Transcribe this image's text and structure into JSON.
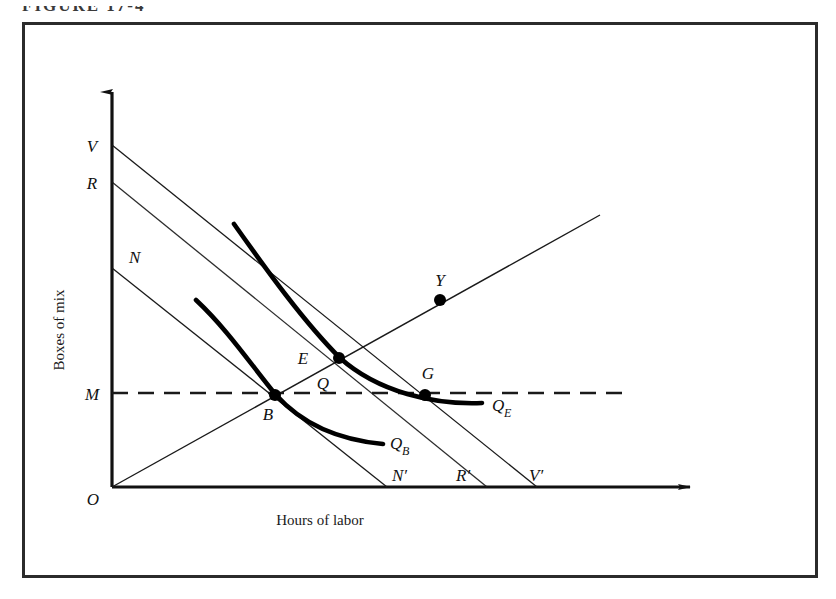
{
  "figure": {
    "title": "FIGURE 17-4",
    "frame": {
      "x": 22,
      "y": 22,
      "width": 796,
      "height": 556,
      "stroke": "#2b2b2b"
    }
  },
  "axes": {
    "y_title": "Boxes of mix",
    "x_title": "Hours of labor",
    "origin_label": "O",
    "y_axis": {
      "x": 112,
      "y_bottom": 487,
      "y_top": 82
    },
    "x_axis": {
      "y": 487,
      "x_left": 112,
      "x_right": 700
    }
  },
  "intercepts": {
    "V": {
      "label": "V",
      "x": 112,
      "y": 145
    },
    "R": {
      "label": "R",
      "x": 112,
      "y": 182
    },
    "N": {
      "label": "N",
      "x": 112,
      "y": 268
    },
    "M": {
      "label": "M",
      "x": 112,
      "y": 393
    },
    "Nprime": {
      "label": "N′",
      "x": 387,
      "y": 487
    },
    "Rprime": {
      "label": "R′",
      "x": 487,
      "y": 487
    },
    "Vprime": {
      "label": "V′",
      "x": 537,
      "y": 487
    }
  },
  "budget_lines": [
    {
      "name": "VV'",
      "from": [
        112,
        145
      ],
      "to": [
        537,
        487
      ]
    },
    {
      "name": "RR'",
      "from": [
        112,
        182
      ],
      "to": [
        487,
        487
      ]
    },
    {
      "name": "NN'",
      "from": [
        112,
        268
      ],
      "to": [
        387,
        487
      ]
    }
  ],
  "expansion_ray": {
    "name": "OY",
    "from": [
      112,
      487
    ],
    "to": [
      600,
      215
    ]
  },
  "dashed_line": {
    "name": "M-level",
    "from": [
      112,
      393
    ],
    "to": [
      625,
      393
    ]
  },
  "curves": [
    {
      "name": "Q_B",
      "label": "Q",
      "label_sub": "B",
      "label_pos": [
        390,
        443
      ],
      "path": "M 196,300 C 228,330 252,366 276,395 C 302,424 340,440 383,444"
    },
    {
      "name": "Q_E",
      "label": "Q",
      "label_sub": "E",
      "label_pos": [
        494,
        411
      ],
      "path": "M 234,224 C 268,272 304,322 340,358 C 378,392 434,405 482,403"
    }
  ],
  "points": [
    {
      "label": "B",
      "x": 275,
      "y": 395,
      "label_pos": [
        268,
        418
      ]
    },
    {
      "label": "E",
      "x": 339,
      "y": 358,
      "label_pos": [
        301,
        362
      ]
    },
    {
      "label": "G",
      "x": 425,
      "y": 395,
      "label_pos": [
        418,
        378
      ]
    },
    {
      "label": "Y",
      "x": 440,
      "y": 300,
      "label_pos": [
        432,
        285
      ]
    }
  ],
  "annotations": [
    {
      "label": "Q",
      "x": 318,
      "y": 383
    }
  ],
  "colors": {
    "line": "#1a1a1a",
    "curve": "#000000",
    "frame": "#2b2b2b",
    "background": "#ffffff"
  }
}
